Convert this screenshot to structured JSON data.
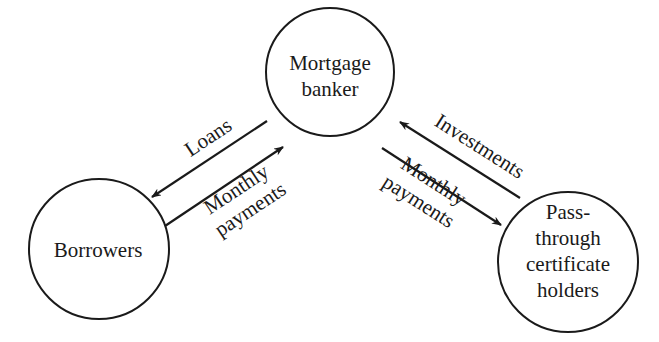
{
  "diagram": {
    "nodes": [
      {
        "id": "mortgage-banker",
        "lines": [
          "Mortgage",
          "banker"
        ]
      },
      {
        "id": "borrowers",
        "lines": [
          "Borrowers"
        ]
      },
      {
        "id": "pass-through",
        "lines": [
          "Pass-",
          "through",
          "certificate",
          "holders"
        ]
      }
    ],
    "flows": [
      {
        "id": "loans",
        "from": "mortgage-banker",
        "to": "borrowers",
        "lines": [
          "Loans"
        ]
      },
      {
        "id": "borrower-payments",
        "from": "borrowers",
        "to": "mortgage-banker",
        "lines": [
          "Monthly",
          "payments"
        ]
      },
      {
        "id": "investments",
        "from": "pass-through",
        "to": "mortgage-banker",
        "lines": [
          "Investments"
        ]
      },
      {
        "id": "holder-payments",
        "from": "mortgage-banker",
        "to": "pass-through",
        "lines": [
          "Monthly",
          "payments"
        ]
      }
    ],
    "colors": {
      "stroke": "#1a1a1a",
      "background": "#ffffff"
    }
  }
}
